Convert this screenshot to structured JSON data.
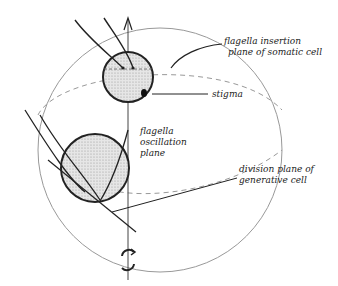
{
  "diagram": {
    "labels": {
      "flagella_insertion": [
        "flagella insertion",
        "plane of somatic cell"
      ],
      "stigma": "stigma",
      "flagella_oscillation": [
        "flagella",
        "oscillation",
        "plane"
      ],
      "division_plane": [
        "division plane of",
        "generative cell"
      ]
    },
    "symbols": {
      "top_arrow": "arrow-up-icon",
      "rotation": "rotation-icon"
    },
    "colors": {
      "ink": "#222222",
      "sphere_outline": "#888888",
      "cell_fill": "#d4d4d4"
    }
  }
}
